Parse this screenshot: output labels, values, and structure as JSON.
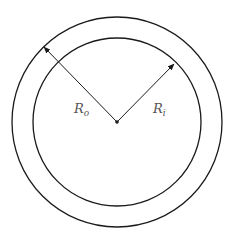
{
  "diagram": {
    "title": "",
    "center": {
      "x": 117,
      "y": 122
    },
    "outer_circle": {
      "radius": 105,
      "label": "R",
      "label_sub": "o"
    },
    "inner_circle": {
      "radius": 85,
      "label": "R",
      "label_sub": "i"
    },
    "colors": {
      "stroke": "#1a1a1a",
      "label": "#555555"
    }
  }
}
